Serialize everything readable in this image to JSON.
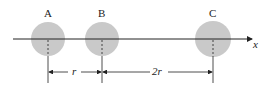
{
  "diagram": {
    "colors": {
      "sphere": "#c9c9c9",
      "line": "#222222",
      "background": "#ffffff"
    },
    "axis": {
      "label": "x"
    },
    "spheres": [
      {
        "label": "A"
      },
      {
        "label": "B"
      },
      {
        "label": "C"
      }
    ],
    "dimensions": [
      {
        "label": "r",
        "from": "A",
        "to": "B"
      },
      {
        "label": "2r",
        "from": "B",
        "to": "C"
      }
    ]
  }
}
